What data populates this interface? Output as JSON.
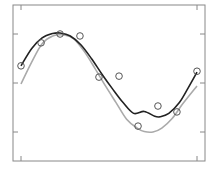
{
  "chart_data": {
    "type": "scatter",
    "title": "",
    "xlabel": "",
    "ylabel": "",
    "xlim": [
      -0.045,
      1.045
    ],
    "ylim": [
      -1.59,
      1.59
    ],
    "x_ticks": [
      0,
      1
    ],
    "y_ticks": [
      -1,
      0,
      1
    ],
    "x_tick_labels": [],
    "y_tick_labels": [],
    "grid": false,
    "legend": null,
    "series": [
      {
        "name": "observations",
        "kind": "markers",
        "marker": "open-circle",
        "color": "#555555",
        "x": [
          0.0,
          0.114,
          0.222,
          0.335,
          0.443,
          0.557,
          0.665,
          0.778,
          0.886,
          1.0
        ],
        "y": [
          0.35,
          0.82,
          1.0,
          0.96,
          0.12,
          0.14,
          -0.88,
          -0.47,
          -0.59,
          0.24
        ]
      },
      {
        "name": "fit",
        "kind": "line",
        "color": "#222222",
        "x": [
          0.0,
          0.06,
          0.12,
          0.18,
          0.222,
          0.28,
          0.34,
          0.4,
          0.46,
          0.52,
          0.58,
          0.64,
          0.7,
          0.76,
          0.79,
          0.84,
          0.9,
          0.95,
          1.0
        ],
        "y": [
          0.35,
          0.7,
          0.92,
          1.01,
          1.02,
          0.96,
          0.78,
          0.5,
          0.18,
          -0.12,
          -0.4,
          -0.62,
          -0.58,
          -0.68,
          -0.69,
          -0.62,
          -0.4,
          -0.1,
          0.22
        ]
      },
      {
        "name": "true-function",
        "kind": "line",
        "color": "#aaaaaa",
        "x": [
          0.0,
          0.06,
          0.12,
          0.18,
          0.245,
          0.3,
          0.36,
          0.42,
          0.48,
          0.54,
          0.6,
          0.66,
          0.7,
          0.75,
          0.8,
          0.86,
          0.92,
          1.0
        ],
        "y": [
          -0.02,
          0.42,
          0.8,
          0.96,
          0.98,
          0.9,
          0.64,
          0.3,
          -0.06,
          -0.4,
          -0.74,
          -0.92,
          -0.99,
          -1.0,
          -0.92,
          -0.72,
          -0.42,
          -0.06
        ]
      }
    ]
  },
  "plot": {
    "frame_color": "#888888",
    "tick_color": "#888888"
  }
}
